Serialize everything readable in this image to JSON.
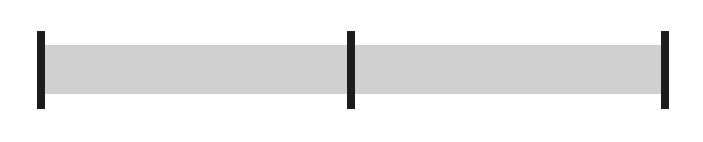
{
  "chord": {
    "name": "Cmaj7"
  },
  "colors": {
    "band": "#cfcfcf",
    "bar": "#1c1c1c",
    "stroke": "#222222"
  },
  "measures": [
    {
      "strokes": [
        [
          59,
          98
        ],
        [
          136,
          177
        ],
        [
          214,
          256
        ],
        [
          293,
          332
        ]
      ]
    },
    {
      "strokes": [
        [
          370,
          410
        ],
        [
          447,
          488
        ],
        [
          526,
          565
        ],
        [
          600,
          640
        ]
      ]
    }
  ],
  "barlines_x": [
    37,
    347,
    661
  ],
  "lyrics": [
    {
      "text": "These ___",
      "x": 38
    },
    {
      "text": "are",
      "x": 127
    },
    {
      "text": "the things ___",
      "x": 164
    },
    {
      "text": "I",
      "x": 291
    },
    {
      "text": "can",
      "x": 318
    },
    {
      "text": "do ____",
      "x": 363
    },
    {
      "text": "with-out.",
      "x": 432
    },
    {
      "text": "Come ___",
      "x": 580
    }
  ]
}
